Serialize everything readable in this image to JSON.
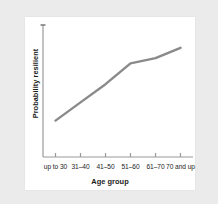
{
  "chart_data": {
    "type": "line",
    "title": "",
    "subtitle": "",
    "xlabel": "Age group",
    "ylabel": "Probability resilient",
    "categories": [
      "up to 30",
      "31–40",
      "41–50",
      "51–60",
      "61–70",
      "70 and up"
    ],
    "series": [
      {
        "name": "Probability resilient",
        "values": [
          0.28,
          0.42,
          0.56,
          0.72,
          0.76,
          0.84
        ],
        "color": "#8a8a8a"
      }
    ],
    "ylim": [
      0,
      1
    ],
    "y_tick_labels": [],
    "x_tick_labels": [
      "up to 30",
      "31–40",
      "41–50",
      "51–60",
      "61–70",
      "70 and up"
    ],
    "grid": false,
    "legend": false,
    "legend_position": "none",
    "annotations": [],
    "axis_color": "#9a9a9a",
    "text_color": "#1b1b1b",
    "background": "#ffffff",
    "page_background": "#ebebeb"
  },
  "figure": {
    "y_axis_title": "Probability resilient",
    "x_axis_title": "Age group"
  }
}
